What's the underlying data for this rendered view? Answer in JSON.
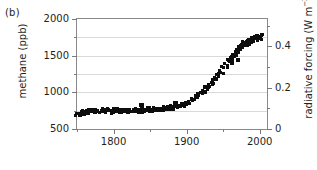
{
  "panel": {
    "label": "(b)"
  },
  "chart_data": {
    "type": "scatter",
    "title": "",
    "subtitle": "",
    "xlabel": "",
    "ylabel": "methane (ppb)",
    "ylabel_right_text": "radiative forcing (W m",
    "ylabel_right_sup": "−2",
    "ylabel_right_tail": ")",
    "ylabel_right_full": "radiative forcing (W m−2)",
    "xlim": [
      1750,
      2010
    ],
    "ylim": [
      500,
      2000
    ],
    "ylim_right": [
      0.0,
      0.5333
    ],
    "grid": true,
    "legend": null,
    "x_major_ticks": [
      1800,
      1900,
      2000
    ],
    "x_major_labels": [
      "1800",
      "1900",
      "2000"
    ],
    "x_minor_ticks": [
      1750,
      1850,
      1950
    ],
    "y_major_ticks": [
      500,
      1000,
      1500,
      2000
    ],
    "y_major_labels": [
      "500",
      "1000",
      "1500",
      "2000"
    ],
    "y_minor_ticks": [
      750,
      1250,
      1750
    ],
    "y_right_major_ticks": [
      0,
      0.2,
      0.4
    ],
    "y_right_major_labels": [
      "0",
      "0.2",
      "0.4"
    ],
    "y_right_minor_ticks": [
      0.1,
      0.3,
      0.5
    ],
    "marker": "square",
    "marker_color": "#0d0d0d",
    "marker_size_px": 3,
    "series": [
      {
        "name": "atmospheric methane concentration",
        "x": [
          1750,
          1753,
          1756,
          1759,
          1762,
          1765,
          1768,
          1771,
          1774,
          1777,
          1780,
          1783,
          1786,
          1789,
          1792,
          1795,
          1798,
          1801,
          1804,
          1807,
          1810,
          1813,
          1816,
          1819,
          1822,
          1825,
          1828,
          1831,
          1834,
          1837,
          1840,
          1843,
          1846,
          1849,
          1852,
          1855,
          1858,
          1861,
          1864,
          1867,
          1870,
          1873,
          1876,
          1879,
          1882,
          1885,
          1888,
          1891,
          1894,
          1897,
          1900,
          1903,
          1906,
          1909,
          1912,
          1915,
          1918,
          1921,
          1924,
          1927,
          1930,
          1933,
          1936,
          1939,
          1942,
          1945,
          1948,
          1951,
          1954,
          1957,
          1960,
          1963,
          1966,
          1969,
          1972,
          1975,
          1978,
          1981,
          1984,
          1987,
          1990,
          1993,
          1996,
          1999,
          2002
        ],
        "y": [
          700,
          712,
          725,
          718,
          735,
          742,
          728,
          745,
          752,
          738,
          748,
          755,
          742,
          760,
          748,
          735,
          742,
          755,
          748,
          762,
          752,
          745,
          738,
          750,
          742,
          756,
          748,
          762,
          755,
          745,
          760,
          752,
          768,
          758,
          765,
          772,
          762,
          775,
          768,
          782,
          775,
          790,
          782,
          798,
          788,
          805,
          812,
          822,
          830,
          845,
          858,
          872,
          888,
          905,
          925,
          948,
          968,
          992,
          1015,
          1048,
          1078,
          1108,
          1145,
          1178,
          1212,
          1248,
          1285,
          1322,
          1368,
          1412,
          1452,
          1488,
          1522,
          1558,
          1592,
          1622,
          1652,
          1672,
          1692,
          1705,
          1718,
          1728,
          1738,
          1745,
          1750
        ],
        "outliers_x": [
          1838,
          1885,
          1925,
          1962,
          1970
        ],
        "outliers_y": [
          830,
          852,
          1075,
          1405,
          1438
        ]
      }
    ]
  }
}
